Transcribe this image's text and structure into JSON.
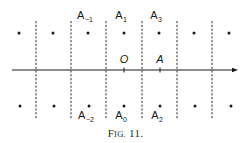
{
  "figure": {
    "caption": {
      "prefix": "F",
      "smallcaps": "IG.",
      "number": "11."
    },
    "colors": {
      "ink": "#1a1a1a",
      "background": "#ffffff"
    },
    "axis": {
      "y": 70,
      "x_start": 12,
      "x_end": 238,
      "arrow": "right"
    },
    "dashed_lines": {
      "x": [
        36,
        71,
        106,
        142,
        177,
        212
      ],
      "y_top": 21,
      "y_bottom": 119
    },
    "top_row_dots": {
      "y": 33,
      "x": [
        19,
        53,
        88,
        124,
        159,
        194,
        229
      ]
    },
    "bottom_row_dots": {
      "y": 106,
      "x": [
        20,
        54,
        89,
        124,
        160,
        195,
        231
      ]
    },
    "axis_ticks": [
      {
        "x": 124,
        "label": "O"
      },
      {
        "x": 160,
        "label": "A"
      }
    ],
    "top_labels": [
      {
        "x": 88,
        "base": "A",
        "sub": "−1"
      },
      {
        "x": 124,
        "base": "A",
        "sub": "1"
      },
      {
        "x": 159,
        "base": "A",
        "sub": "3"
      }
    ],
    "bottom_labels": [
      {
        "x": 89,
        "base": "A",
        "sub": "−2"
      },
      {
        "x": 124,
        "base": "A",
        "sub": "0"
      },
      {
        "x": 160,
        "base": "A",
        "sub": "2"
      }
    ]
  }
}
